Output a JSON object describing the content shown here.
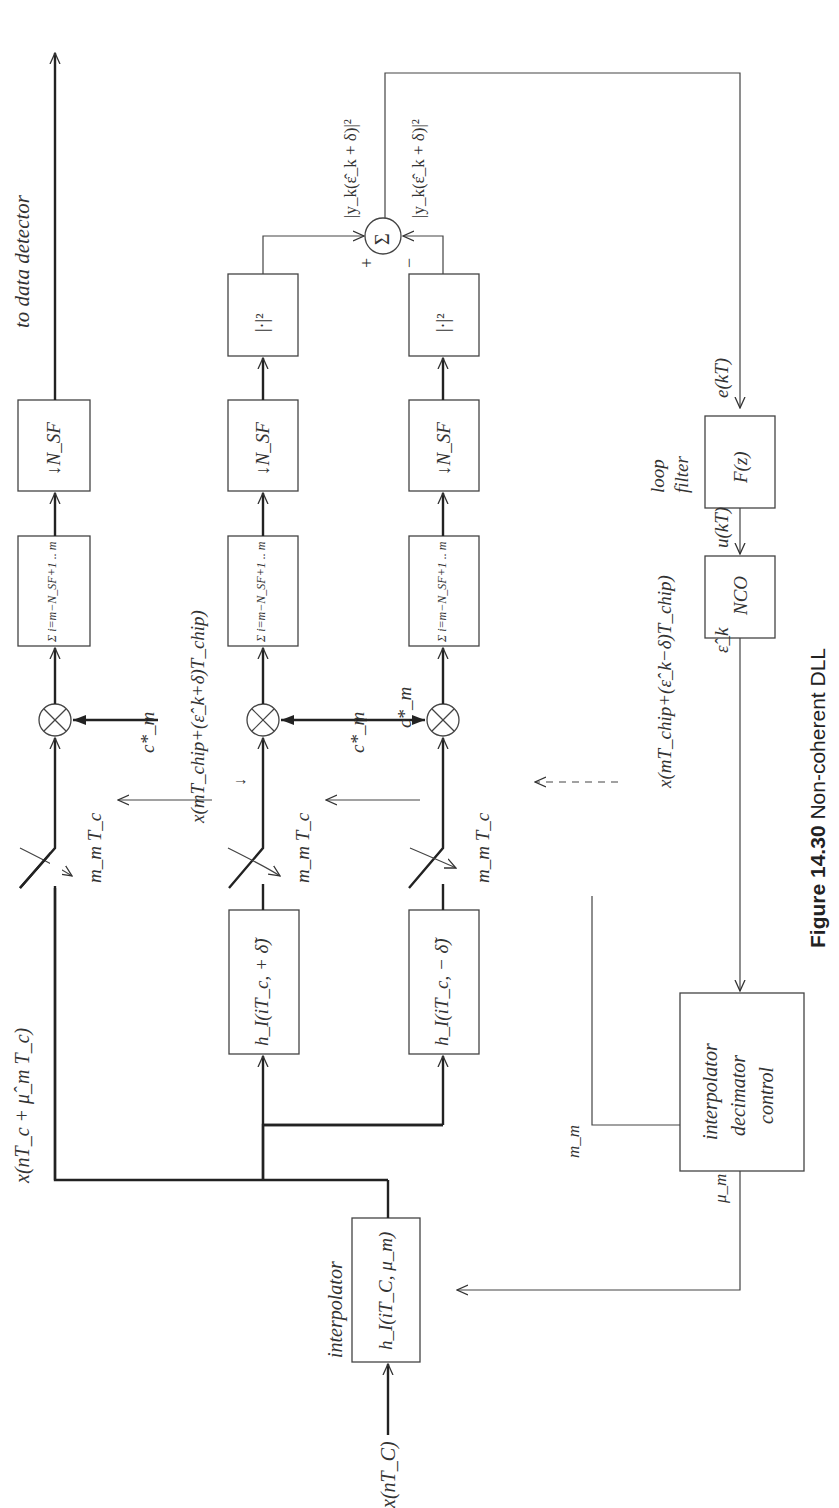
{
  "figure": {
    "caption_number": "Figure 14.30",
    "caption_text": "Non-coherent DLL"
  },
  "signals": {
    "input": "x(nT_C)",
    "interp_out": "x(nT_c + μ̂_m T_c)",
    "early_sample": "x(mT_chip+(ε̂_k+δ)T_chip)",
    "late_sample": "x(mT_chip+(ε̂_k−δ)T_chip)",
    "late_arrow_glyph": "↓",
    "code_top": "c*_m",
    "code_mid": "c*_m",
    "code_bot": "c*_m",
    "sample_time_top": "m_m T_c",
    "sample_time_mid": "m_m T_c",
    "sample_time_bot": "m_m T_c",
    "sum_in_plus": "|y_k(ε̂_k + δ)|²",
    "sum_in_minus": "|y_k(ε̂_k + δ)|²",
    "plus_sign": "+",
    "minus_sign": "−",
    "error": "e(kT)",
    "control": "u(kT)",
    "nco_out": "ε̂_k",
    "m_m": "m_m",
    "mu_m": "μ_m",
    "to_detector": "to data detector"
  },
  "blocks": {
    "interpolator_label": "interpolator",
    "interpolator": "h_I(iT_C, μ_m)",
    "filter_plus": "h_I(iT_c, + δ̃)",
    "filter_minus": "h_I(iT_c, − δ̃)",
    "sum_top": "Σ i=m−N_SF+1 .. m",
    "sum_mid": "Σ i=m−N_SF+1 .. m",
    "sum_bot": "Σ i=m−N_SF+1 .. m",
    "decim_top": "↓N_SF",
    "decim_mid": "↓N_SF",
    "decim_bot": "↓N_SF",
    "square_mid": "|·|²",
    "square_bot": "|·|²",
    "adder": "Σ",
    "loop_filter_label_1": "loop",
    "loop_filter_label_2": "filter",
    "loop_filter": "F(z)",
    "nco": "NCO",
    "control_1": "interpolator",
    "control_2": "decimator",
    "control_3": "control"
  }
}
